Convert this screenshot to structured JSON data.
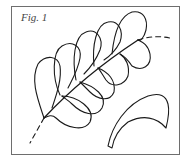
{
  "figure": {
    "caption": "Fig. 1",
    "elements": [
      {
        "name": "feather-spine",
        "style": "solid curved line with dashed extensions"
      },
      {
        "name": "feather-plumes",
        "count": 10
      },
      {
        "name": "single-plume-template",
        "style": "separate curved plume shape"
      }
    ],
    "colors": {
      "line": "#1a1a1a",
      "border": "#6e6e6e",
      "background": "#ffffff"
    }
  }
}
